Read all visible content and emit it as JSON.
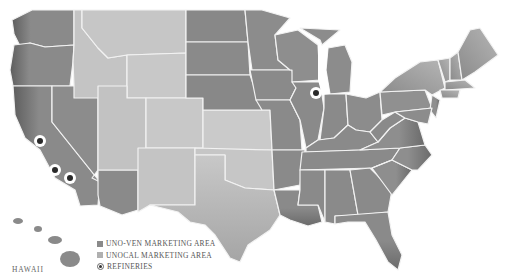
{
  "map": {
    "title": "",
    "colors": {
      "uno_ven": "#8a8a8a",
      "unocal": "#c4c4c4",
      "border": "#f2f2f2",
      "refinery_ring": "#ffffff",
      "refinery_dot": "#2a2a2a"
    },
    "uno_ven_states": [
      "WA",
      "OR",
      "CA",
      "NV",
      "AZ",
      "ND",
      "SD",
      "NE",
      "MN",
      "IA",
      "MO",
      "AR",
      "LA",
      "WI",
      "IL",
      "MI",
      "IN",
      "OH",
      "KY",
      "TN",
      "MS",
      "AL",
      "GA",
      "FL",
      "SC",
      "NC",
      "VA",
      "WV",
      "PA",
      "NY",
      "VT",
      "NH",
      "ME",
      "MA",
      "CT",
      "RI",
      "NJ",
      "DE",
      "MD"
    ],
    "unocal_states": [
      "ID",
      "MT",
      "WY",
      "UT",
      "CO",
      "NM",
      "KS",
      "OK",
      "TX"
    ],
    "refineries": [
      {
        "x": 40,
        "y": 141
      },
      {
        "x": 55,
        "y": 170
      },
      {
        "x": 70,
        "y": 178
      },
      {
        "x": 316,
        "y": 93
      }
    ],
    "inset_label": "HAWAII"
  },
  "legend": {
    "items": [
      {
        "label": "UNO-VEN MARKETING AREA",
        "type": "swatch",
        "color": "#8a8a8a"
      },
      {
        "label": "UNOCAL MARKETING AREA",
        "type": "swatch",
        "color": "#b0b0b0"
      },
      {
        "label": "REFINERIES",
        "type": "refinery"
      }
    ]
  }
}
